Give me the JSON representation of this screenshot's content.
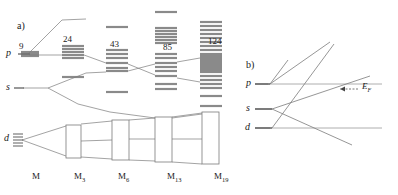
{
  "figure": {
    "panel_a": {
      "label": "a)",
      "orbital_labels": [
        {
          "name": "p",
          "text": "p"
        },
        {
          "name": "s",
          "text": "s"
        },
        {
          "name": "d",
          "text": "d"
        }
      ],
      "electron_counts": [
        {
          "text": "9",
          "x": 19,
          "y": 42
        },
        {
          "text": "24",
          "x": 63,
          "y": 35
        },
        {
          "text": "43",
          "x": 110,
          "y": 40
        },
        {
          "text": "85",
          "x": 163,
          "y": 43
        },
        {
          "text": "124",
          "x": 208,
          "y": 37
        }
      ],
      "x_axis_labels": [
        {
          "base": "M",
          "sub": "",
          "x": 32
        },
        {
          "base": "M",
          "sub": "3",
          "x": 74
        },
        {
          "base": "M",
          "sub": "6",
          "x": 118
        },
        {
          "base": "M",
          "sub": "13",
          "x": 167
        },
        {
          "base": "M",
          "sub": "19",
          "x": 214
        }
      ],
      "columns": [
        {
          "name": "M",
          "x_center": 30,
          "half_width": 9,
          "levels": [
            52,
            54,
            56
          ]
        },
        {
          "name": "M3",
          "x_center": 73,
          "half_width": 11,
          "levels": [
            46,
            49,
            52,
            55,
            58,
            77
          ]
        },
        {
          "name": "M6",
          "x_center": 117,
          "half_width": 11,
          "levels": [
            27,
            50,
            54,
            58,
            63,
            68,
            71,
            92
          ]
        },
        {
          "name": "M13",
          "x_center": 166,
          "half_width": 11,
          "levels": [
            12,
            28,
            31,
            34,
            37,
            40,
            43,
            54,
            58,
            63,
            67,
            71,
            76,
            84,
            89
          ]
        },
        {
          "name": "M19",
          "x_center": 211,
          "half_width": 11,
          "levels": [
            22,
            26,
            30,
            34,
            38,
            42,
            46,
            50,
            54,
            56,
            58,
            60,
            62,
            64,
            66,
            68,
            70,
            72,
            76,
            80,
            84,
            88,
            96,
            106
          ]
        }
      ],
      "correlation_lines": [
        {
          "from": "p",
          "to": "M3-top"
        },
        {
          "from": "p",
          "to": "M6"
        },
        {
          "from": "s",
          "to": "M6"
        },
        {
          "from": "s",
          "to": "M13"
        },
        {
          "from": "p",
          "to": "M19"
        },
        {
          "from": "d",
          "to": "band"
        }
      ],
      "d_band_boxes": [
        {
          "name": "band-box-M6",
          "x": 66,
          "y": 125,
          "w": 15,
          "h": 33
        },
        {
          "name": "band-box-M13",
          "x": 112,
          "y": 120,
          "w": 17,
          "h": 40
        },
        {
          "name": "band-box-M19",
          "x": 155,
          "y": 117,
          "w": 17,
          "h": 45
        },
        {
          "name": "band-box-M19b",
          "x": 202,
          "y": 112,
          "w": 17,
          "h": 52
        }
      ]
    },
    "panel_b": {
      "label": "b)",
      "orbital_labels": [
        {
          "name": "p",
          "text": "p",
          "x": 248,
          "y": 84
        },
        {
          "name": "s",
          "text": "s",
          "x": 248,
          "y": 109
        },
        {
          "name": "d",
          "text": "d",
          "x": 248,
          "y": 128
        }
      ],
      "fermi_label": {
        "base": "E",
        "sub": "F"
      },
      "fermi_arrow": true
    }
  },
  "colors": {
    "level_fill": "#8a8a8a",
    "line": "#6e6e6e",
    "box_stroke": "#7a7a7a",
    "text": "#1a1a1a",
    "background": "#ffffff"
  }
}
